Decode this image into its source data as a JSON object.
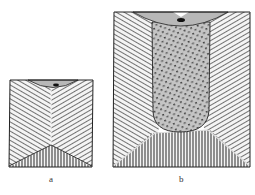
{
  "figure": {
    "panels": [
      {
        "id": "a",
        "label": "a",
        "description": "Small ingot cross-section: columnar zones converging in V, chill zone at bottom, shrink cavity at top"
      },
      {
        "id": "b",
        "label": "b",
        "description": "Large ingot cross-section: columnar zones on sides, dotted equiaxed core zone, vertical-hatched bottom cone zone, shrink cavity at top"
      }
    ],
    "caption": "",
    "colors": {
      "background": "#ffffff",
      "outline": "#222222",
      "hatch_line": "#3a3a3a",
      "cap_fill": "#b8b8b8",
      "core_fill": "#c4c4c4",
      "core_dot": "#444444",
      "cavity": "#111111"
    }
  }
}
